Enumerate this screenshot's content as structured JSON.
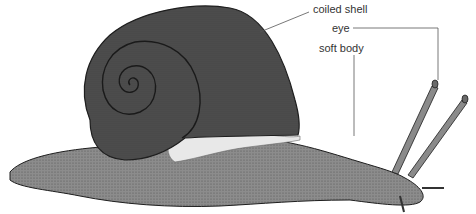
{
  "diagram": {
    "labels": {
      "coiled_shell": "coiled shell",
      "eye": "eye",
      "soft_body": "soft body"
    },
    "colors": {
      "shell": "#4a4a4a",
      "body": "#8a8a8a",
      "outline": "#1e1e1e",
      "leader_line": "#555555"
    }
  }
}
